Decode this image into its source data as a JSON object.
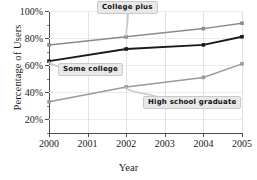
{
  "chart_data": {
    "type": "line",
    "title": "",
    "xlabel": "Year",
    "ylabel": "Percentage of Users",
    "x": [
      2000,
      2002,
      2004,
      2005
    ],
    "categories": [
      "2000",
      "2002",
      "2004",
      "2005"
    ],
    "xlim": [
      2000,
      2005
    ],
    "ylim": [
      10,
      100
    ],
    "xticks": [
      "2000",
      "2001",
      "2002",
      "2003",
      "2004",
      "2005"
    ],
    "yticks": [
      "20%",
      "40%",
      "60%",
      "80%",
      "100%"
    ],
    "ytick_values": [
      20,
      40,
      60,
      80,
      100
    ],
    "grid": true,
    "legend_position": "inline-callouts",
    "series": [
      {
        "name": "College plus",
        "color": "#8a8a8a",
        "values": [
          75,
          81,
          87,
          91
        ]
      },
      {
        "name": "Some college",
        "color": "#1a1a1a",
        "values": [
          63,
          72,
          75,
          81
        ]
      },
      {
        "name": "High school graduate",
        "color": "#9a9a9a",
        "values": [
          33,
          44,
          51,
          61
        ]
      }
    ],
    "annotations": [
      {
        "label": "College plus",
        "target_x": 2002,
        "target_y": 81
      },
      {
        "label": "Some college",
        "target_x": 2000,
        "target_y": 63
      },
      {
        "label": "High school graduate",
        "target_x": 2002,
        "target_y": 44
      }
    ]
  }
}
